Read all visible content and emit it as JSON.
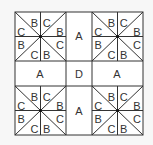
{
  "diagram": {
    "colors": {
      "background": "#f7f7f7",
      "block": "#ffffff",
      "line": "#333333",
      "text": "#333333"
    },
    "quadrant_labels": {
      "top_left_row1": [
        "C",
        "B",
        "C",
        "B"
      ],
      "labels_per_quadrant": [
        {
          "pos": "top",
          "a": "B",
          "b": "C"
        },
        {
          "pos": "left",
          "a": "C",
          "b": "B"
        },
        {
          "pos": "right",
          "a": "B",
          "b": "C"
        },
        {
          "pos": "bottom",
          "a": "C",
          "b": "B"
        }
      ]
    },
    "sashing": {
      "top": "A",
      "left": "A",
      "center": "D",
      "right": "A",
      "bottom": "A"
    }
  }
}
